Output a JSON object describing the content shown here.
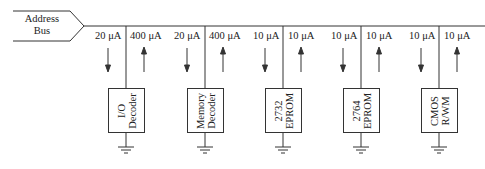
{
  "bus": {
    "label_line1": "Address",
    "label_line2": "Bus"
  },
  "devices": [
    {
      "id": "io-decoder",
      "line1": "I/O",
      "line2": "Decoder",
      "in_current": "20 μA",
      "out_current": "400 μA"
    },
    {
      "id": "memory-decoder",
      "line1": "Memory",
      "line2": "Decoder",
      "in_current": "20 μA",
      "out_current": "400 μA"
    },
    {
      "id": "eprom-2732",
      "line1": "2732",
      "line2": "EPROM",
      "in_current": "10 μA",
      "out_current": "10 μA"
    },
    {
      "id": "eprom-2764",
      "line1": "2764",
      "line2": "EPROM",
      "in_current": "10 μA",
      "out_current": "10 μA"
    },
    {
      "id": "cmos-rwm",
      "line1": "CMOS",
      "line2": "R/WM",
      "in_current": "10 μA",
      "out_current": "10 μA"
    }
  ],
  "colors": {
    "line": "#333333",
    "background": "#ffffff"
  }
}
